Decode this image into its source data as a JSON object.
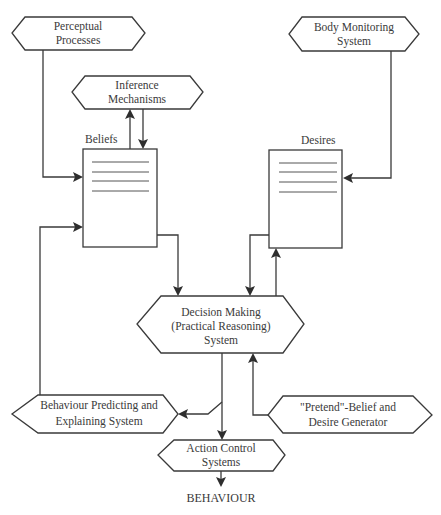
{
  "diagram": {
    "nodes": {
      "perceptual": {
        "line1": "Perceptual",
        "line2": "Processes"
      },
      "inference": {
        "line1": "Inference",
        "line2": "Mechanisms"
      },
      "body_monitoring": {
        "line1": "Body Monitoring",
        "line2": "System"
      },
      "beliefs": {
        "label": "Beliefs"
      },
      "desires": {
        "label": "Desires"
      },
      "decision": {
        "line1": "Decision Making",
        "line2": "(Practical Reasoning)",
        "line3": "System"
      },
      "behaviour_predicting": {
        "line1": "Behaviour Predicting and",
        "line2": "Explaining System"
      },
      "pretend": {
        "line1": "\"Pretend\"-Belief and",
        "line2": "Desire Generator"
      },
      "action_control": {
        "line1": "Action Control",
        "line2": "Systems"
      },
      "output": {
        "label": "BEHAVIOUR"
      }
    },
    "edges": [
      {
        "from": "Perceptual Processes",
        "to": "Beliefs"
      },
      {
        "from": "Beliefs",
        "to": "Inference Mechanisms"
      },
      {
        "from": "Inference Mechanisms",
        "to": "Beliefs"
      },
      {
        "from": "Body Monitoring System",
        "to": "Desires"
      },
      {
        "from": "Beliefs",
        "to": "Decision Making (Practical Reasoning) System"
      },
      {
        "from": "Desires",
        "to": "Decision Making (Practical Reasoning) System"
      },
      {
        "from": "Decision Making (Practical Reasoning) System",
        "to": "Desires"
      },
      {
        "from": "Decision Making (Practical Reasoning) System",
        "to": "Behaviour Predicting and Explaining System"
      },
      {
        "from": "Behaviour Predicting and Explaining System",
        "to": "Beliefs"
      },
      {
        "from": "Decision Making (Practical Reasoning) System",
        "to": "Action Control Systems"
      },
      {
        "from": "\"Pretend\"-Belief and Desire Generator",
        "to": "Decision Making (Practical Reasoning) System"
      },
      {
        "from": "Action Control Systems",
        "to": "BEHAVIOUR"
      }
    ]
  }
}
